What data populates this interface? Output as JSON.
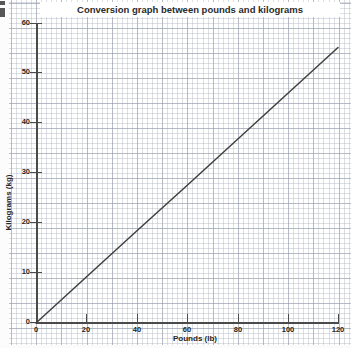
{
  "chart_data": {
    "type": "line",
    "title": "Conversion graph between pounds and kilograms",
    "xlabel": "Pounds (lb)",
    "ylabel": "Kilograms (kg)",
    "xlim": [
      0,
      120
    ],
    "ylim": [
      0,
      60
    ],
    "xticks": [
      0,
      20,
      40,
      60,
      80,
      100,
      120
    ],
    "yticks": [
      0,
      10,
      20,
      30,
      40,
      50,
      60
    ],
    "xtick_labels": [
      "0",
      "20",
      "40",
      "60",
      "80",
      "100",
      "120"
    ],
    "ytick_labels": [
      "0",
      "10",
      "20",
      "30",
      "40",
      "50",
      "60"
    ],
    "grid": true,
    "grid_style": "graph-paper",
    "legend": "none",
    "series": [
      {
        "name": "pounds to kilograms conversion",
        "color": "#404040",
        "x": [
          0,
          20,
          40,
          60,
          80,
          100,
          120
        ],
        "values": [
          0,
          9.2,
          18.4,
          27.5,
          36.7,
          45.9,
          55.1
        ]
      }
    ],
    "annotations": []
  },
  "axes": {
    "y_origin_label": "0",
    "x_origin_label": "0"
  },
  "icons": {
    "corner_mark": "page-corner-artifact"
  }
}
